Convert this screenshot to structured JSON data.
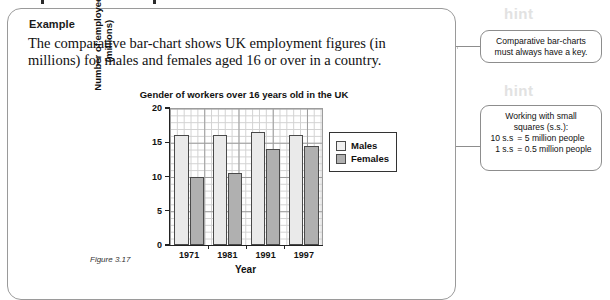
{
  "card": {
    "title": "Example",
    "body": "The comparative bar-chart shows UK employment figures (in millions) for males and females aged 16 or over in a country.",
    "figure_caption": "Figure 3.17"
  },
  "chart_data": {
    "type": "bar",
    "title": "Gender of workers over 16 years old in the UK",
    "xlabel": "Year",
    "ylabel_line1": "Number of employees",
    "ylabel_line2": "(millions)",
    "categories": [
      "1971",
      "1981",
      "1991",
      "1997"
    ],
    "ylim": [
      0,
      20
    ],
    "yticks": [
      "0",
      "5",
      "10",
      "15",
      "20"
    ],
    "ytick_values": [
      0,
      5,
      10,
      15,
      20
    ],
    "grid": true,
    "legend_position": "right",
    "series": [
      {
        "name": "Males",
        "values": [
          16.0,
          16.0,
          16.5,
          16.0
        ],
        "color": "#eaeaea"
      },
      {
        "name": "Females",
        "values": [
          10.0,
          10.5,
          14.0,
          14.5
        ],
        "color": "#b0b0b0"
      }
    ]
  },
  "hints": [
    {
      "heading": "hint",
      "text": "Comparative bar-charts must always have a key."
    },
    {
      "heading": "hint",
      "title_line1": "Working with small",
      "title_line2": "squares (s.s.):",
      "rows": [
        {
          "left": "10 s.s",
          "right": "= 5 million people"
        },
        {
          "left": "1 s.s",
          "right": "= 0.5 million people"
        }
      ]
    }
  ]
}
